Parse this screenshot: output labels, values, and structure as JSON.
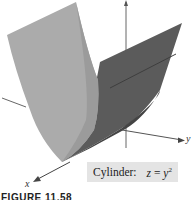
{
  "figure": {
    "caption": "FIGURE 11.58",
    "label": {
      "name": "Cylinder:",
      "equation_lhs": "z",
      "equation_eq": "=",
      "equation_base": "y",
      "equation_exp": "2"
    },
    "axes": {
      "x": "x",
      "y": "y",
      "z": "z"
    },
    "colors": {
      "light_sheet": "#a9a9a9",
      "dark_sheet": "#5a5a5a",
      "axis": "#555555",
      "label_bg": "#e4e4e4"
    }
  }
}
